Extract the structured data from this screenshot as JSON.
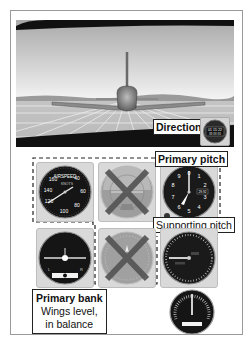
{
  "figure": {
    "view": {
      "description": "Forward view from behind airplane in straight-and-level flight over gridded runway"
    },
    "labels": {
      "direction": "Direction",
      "primary_pitch": "Primary pitch",
      "supporting_pitch": "Supporting pitch",
      "primary_bank": "Primary bank",
      "primary_bank_note_1": "Wings level,",
      "primary_bank_note_2": "in balance"
    },
    "instruments": {
      "airspeed": {
        "title": "AIRSPEED",
        "units": "KNOTS",
        "ticks": [
          "40",
          "60",
          "80",
          "100",
          "120",
          "140",
          "160"
        ]
      },
      "attitude": {
        "crossed_out": true
      },
      "altimeter": {
        "ticks": [
          "0",
          "1",
          "2",
          "3",
          "4",
          "5",
          "6",
          "7",
          "8",
          "9"
        ],
        "kollsman": "29.92"
      },
      "turn_coordinator": {
        "left": "L",
        "right": "R"
      },
      "heading": {
        "crossed_out": true
      },
      "vsi": {
        "role": "supporting pitch"
      },
      "clock": {
        "digits": "01 15 22"
      },
      "tachometer": {}
    },
    "colors": {
      "panel": "#d9d9d9",
      "dial": "#1a1a1a",
      "cross": "#555555",
      "frame": "#9a9a9a"
    }
  }
}
